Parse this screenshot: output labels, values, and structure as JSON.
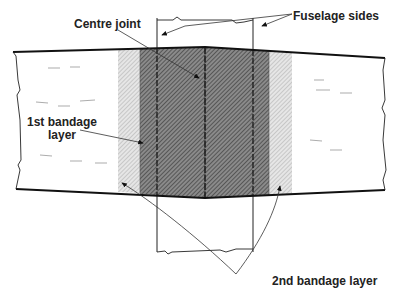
{
  "diagram": {
    "labels": {
      "centre_joint": "Centre joint",
      "fuselage_sides": "Fuselage sides",
      "first_bandage_line1": "1st bandage",
      "first_bandage_line2": "layer",
      "second_bandage": "2nd bandage layer"
    },
    "colors": {
      "outline": "#1a1a1a",
      "dark_hatch": "#6e6e6e",
      "light_hatch": "#c8c8c8",
      "background": "#ffffff"
    }
  }
}
